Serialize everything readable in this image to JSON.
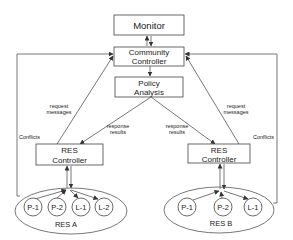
{
  "diagram": {
    "type": "architecture-flow",
    "nodes": {
      "monitor": {
        "label": "Monitor"
      },
      "community_controller": {
        "line1": "Community",
        "line2": "Controller"
      },
      "policy_analysis": {
        "line1": "Policy",
        "line2": "Analysis"
      },
      "res_controller_a": {
        "line1": "RES",
        "line2": "Controller"
      },
      "res_controller_b": {
        "line1": "RES",
        "line2": "Controller"
      }
    },
    "groups": {
      "res_a": {
        "label": "RES A",
        "members": [
          "P-1",
          "P-2",
          "L-1",
          "L-2"
        ]
      },
      "res_b": {
        "label": "RES B",
        "members": [
          "P-1",
          "P-2",
          "L-1"
        ]
      }
    },
    "edge_labels": {
      "request_left": {
        "line1": "request",
        "line2": "messages"
      },
      "request_right": {
        "line1": "request",
        "line2": "messages"
      },
      "response_left": {
        "line1": "response",
        "line2": "results"
      },
      "response_right": {
        "line1": "response",
        "line2": "results"
      },
      "conflicts_left": "Conflicts",
      "conflicts_right": "Conflicts"
    },
    "edges": [
      {
        "from": "Monitor",
        "to": "Community Controller",
        "bidirectional": true
      },
      {
        "from": "Community Controller",
        "to": "Policy Analysis"
      },
      {
        "from": "Policy Analysis",
        "to": "RES Controller (A)",
        "label": "response results"
      },
      {
        "from": "Policy Analysis",
        "to": "RES Controller (B)",
        "label": "response results"
      },
      {
        "from": "RES Controller (A)",
        "to": "Community Controller",
        "label": "request messages"
      },
      {
        "from": "RES Controller (B)",
        "to": "Community Controller",
        "label": "request messages"
      },
      {
        "from": "RES A",
        "to": "Community Controller",
        "label": "Conflicts"
      },
      {
        "from": "RES B",
        "to": "Community Controller",
        "label": "Conflicts"
      },
      {
        "from": "RES A",
        "to": "RES Controller (A)",
        "bidirectional": true
      },
      {
        "from": "RES B",
        "to": "RES Controller (B)",
        "bidirectional": true
      }
    ]
  }
}
